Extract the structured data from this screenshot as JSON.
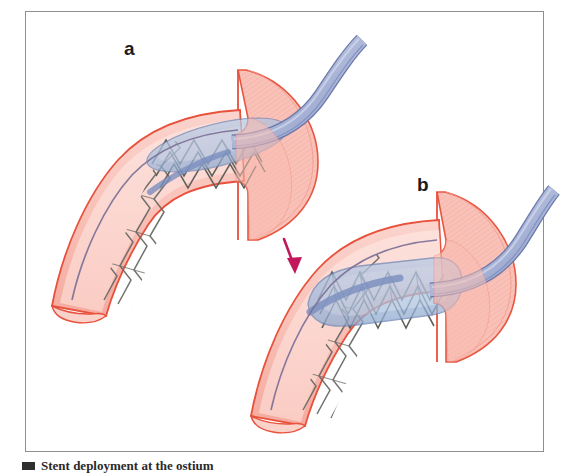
{
  "figure": {
    "kind": "medical-illustration",
    "background_color": "#ffffff",
    "frame": {
      "border_color": "#8f8f8f",
      "x": 25,
      "y": 11,
      "width": 519,
      "height": 441
    },
    "panels": [
      {
        "id": "a",
        "label": "a",
        "label_x": 124,
        "label_y": 39,
        "description": "Stent mounted on a deflated balloon catheter positioned across the vessel ostium"
      },
      {
        "id": "b",
        "label": "b",
        "label_x": 417,
        "label_y": 175,
        "description": "Balloon inflated, expanding the stent against the vessel and ostial wall"
      }
    ],
    "arrow": {
      "name": "progression-arrow",
      "color": "#c2185b",
      "from_x": 284,
      "from_y": 239,
      "to_x": 295,
      "to_y": 273,
      "direction": "down-right"
    },
    "colors": {
      "vessel_wall_outline": "#e8513c",
      "vessel_wall_fill": "#f9c3ba",
      "vessel_lumen_fill": "#fbd9d3",
      "flare_fill": "#f9c0b6",
      "flare_outline": "#e8503b",
      "stent_strut": "#6a6a66",
      "stent_strut_light": "#a8a49c",
      "balloon_fill": "#a8c0e0",
      "balloon_outline": "#6d87b5",
      "catheter_fill": "#8e9cc8",
      "catheter_outline": "#6272a8",
      "catheter_highlight": "#b9c3de",
      "guidewire": "#7a6f96",
      "label_text": "#1b1b1b",
      "frame_border": "#8f8f8f"
    }
  },
  "caption": {
    "text": "Stent deployment at the ostium",
    "marker": "caption-square"
  }
}
